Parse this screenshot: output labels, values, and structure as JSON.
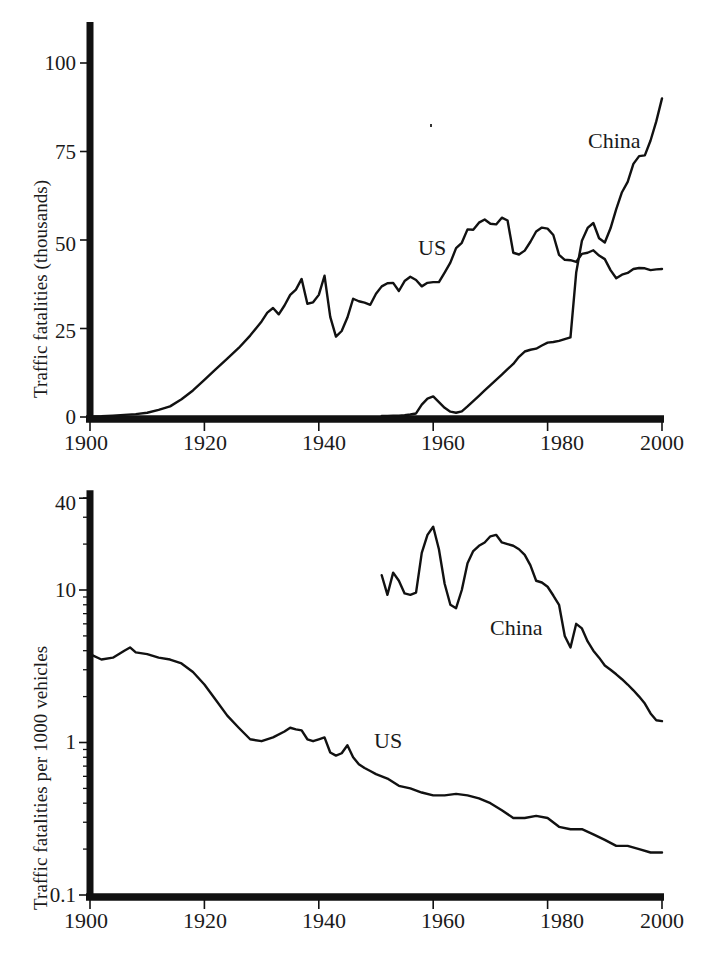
{
  "figure": {
    "background": "#ffffff",
    "ink": "#111111",
    "panels": [
      "top",
      "bottom"
    ]
  },
  "top": {
    "ylabel": "Traffic fatalities (thousands)",
    "xlabel": "",
    "yticks": [
      "0",
      "25",
      "50",
      "75",
      "100"
    ],
    "xticks": [
      "1900",
      "1920",
      "1940",
      "1960",
      "1980",
      "2000"
    ],
    "labels": {
      "us": "US",
      "china": "China"
    }
  },
  "bottom": {
    "ylabel": "Traffic fatalities per 1000 vehicles",
    "xlabel": "",
    "yticks": [
      "0.1",
      "1",
      "10",
      "40"
    ],
    "xticks": [
      "1900",
      "1920",
      "1940",
      "1960",
      "1980",
      "2000"
    ],
    "labels": {
      "us": "US",
      "china": "China"
    }
  },
  "chart_data": [
    {
      "type": "line",
      "id": "top",
      "title": "",
      "xlabel": "",
      "ylabel": "Traffic fatalities (thousands)",
      "xlim": [
        1900,
        2000
      ],
      "ylim": [
        0,
        110
      ],
      "yticks": [
        0,
        25,
        50,
        75,
        100
      ],
      "xticks": [
        1900,
        1920,
        1940,
        1960,
        1980,
        2000
      ],
      "yscale": "linear",
      "grid": false,
      "legend": "inline-annotation",
      "series": [
        {
          "name": "US",
          "label_position": {
            "x": 1958,
            "y": 44
          },
          "x": [
            1900,
            1902,
            1904,
            1906,
            1908,
            1910,
            1912,
            1914,
            1916,
            1918,
            1920,
            1922,
            1924,
            1926,
            1928,
            1930,
            1931,
            1932,
            1933,
            1934,
            1935,
            1936,
            1937,
            1938,
            1939,
            1940,
            1941,
            1942,
            1943,
            1944,
            1945,
            1946,
            1947,
            1948,
            1949,
            1950,
            1951,
            1952,
            1953,
            1954,
            1955,
            1956,
            1957,
            1958,
            1959,
            1960,
            1961,
            1962,
            1963,
            1964,
            1965,
            1966,
            1967,
            1968,
            1969,
            1970,
            1971,
            1972,
            1973,
            1974,
            1975,
            1976,
            1977,
            1978,
            1979,
            1980,
            1981,
            1982,
            1983,
            1984,
            1985,
            1986,
            1987,
            1988,
            1989,
            1990,
            1991,
            1992,
            1993,
            1994,
            1995,
            1996,
            1997,
            1998,
            1999,
            2000
          ],
          "y": [
            0.1,
            0.2,
            0.4,
            0.6,
            0.8,
            1.2,
            2.0,
            3.0,
            5.0,
            7.5,
            10.5,
            13.5,
            16.5,
            19.5,
            23.0,
            27.0,
            29.5,
            30.8,
            29.0,
            31.5,
            34.5,
            36.0,
            39.0,
            32.0,
            32.4,
            34.5,
            39.9,
            28.3,
            22.7,
            24.3,
            28.1,
            33.4,
            32.7,
            32.3,
            31.7,
            34.8,
            36.9,
            37.8,
            37.9,
            35.6,
            38.4,
            39.6,
            38.7,
            36.9,
            37.9,
            38.1,
            38.1,
            40.8,
            43.6,
            47.7,
            49.2,
            53.0,
            52.9,
            54.9,
            55.8,
            54.6,
            54.4,
            56.3,
            55.5,
            46.4,
            45.9,
            47.0,
            49.5,
            52.4,
            53.5,
            53.2,
            51.4,
            45.8,
            44.4,
            44.3,
            43.8,
            46.1,
            46.4,
            47.1,
            45.6,
            44.6,
            41.5,
            39.2,
            40.2,
            40.7,
            41.8,
            42.1,
            42.0,
            41.5,
            41.7,
            41.8
          ]
        },
        {
          "name": "China",
          "label_position": {
            "x": 1988,
            "y": 79
          },
          "x": [
            1951,
            1952,
            1953,
            1954,
            1955,
            1956,
            1957,
            1958,
            1959,
            1960,
            1961,
            1962,
            1963,
            1964,
            1965,
            1966,
            1967,
            1968,
            1969,
            1970,
            1971,
            1972,
            1973,
            1974,
            1975,
            1976,
            1977,
            1978,
            1979,
            1980,
            1981,
            1982,
            1983,
            1984,
            1985,
            1986,
            1987,
            1988,
            1989,
            1990,
            1991,
            1992,
            1993,
            1994,
            1995,
            1996,
            1997,
            1998,
            1999,
            2000
          ],
          "y": [
            0.3,
            0.3,
            0.4,
            0.4,
            0.5,
            0.7,
            1.0,
            3.5,
            5.2,
            5.8,
            4.2,
            2.6,
            1.5,
            1.2,
            1.6,
            3.0,
            4.5,
            6.0,
            7.5,
            9.0,
            10.5,
            12.0,
            13.5,
            15.0,
            17.0,
            18.5,
            19.0,
            19.3,
            20.2,
            21.0,
            21.2,
            21.5,
            22.0,
            22.5,
            40.8,
            49.8,
            53.4,
            54.8,
            50.5,
            49.3,
            53.3,
            58.7,
            63.5,
            66.4,
            71.5,
            73.7,
            73.9,
            78.1,
            83.5,
            90.0
          ]
        }
      ]
    },
    {
      "type": "line",
      "id": "bottom",
      "title": "",
      "xlabel": "",
      "ylabel": "Traffic fatalities per 1000 vehicles",
      "xlim": [
        1900,
        2000
      ],
      "ylim": [
        0.1,
        40
      ],
      "yticks": [
        0.1,
        1,
        10,
        40
      ],
      "xticks": [
        1900,
        1920,
        1940,
        1960,
        1980,
        2000
      ],
      "yscale": "log",
      "grid": false,
      "legend": "inline-annotation",
      "series": [
        {
          "name": "US",
          "label_position": {
            "x": 1950,
            "y": 1.15
          },
          "x": [
            1900,
            1902,
            1904,
            1906,
            1907,
            1908,
            1910,
            1912,
            1914,
            1916,
            1918,
            1920,
            1922,
            1924,
            1926,
            1928,
            1930,
            1932,
            1934,
            1935,
            1936,
            1937,
            1938,
            1939,
            1940,
            1941,
            1942,
            1943,
            1944,
            1945,
            1946,
            1947,
            1948,
            1949,
            1950,
            1952,
            1954,
            1956,
            1958,
            1960,
            1962,
            1964,
            1966,
            1968,
            1970,
            1972,
            1974,
            1976,
            1978,
            1980,
            1982,
            1984,
            1986,
            1988,
            1990,
            1992,
            1994,
            1996,
            1998,
            2000
          ],
          "y": [
            3.8,
            3.5,
            3.6,
            4.0,
            4.2,
            3.9,
            3.8,
            3.6,
            3.5,
            3.3,
            2.9,
            2.4,
            1.9,
            1.5,
            1.25,
            1.05,
            1.02,
            1.08,
            1.18,
            1.25,
            1.22,
            1.2,
            1.05,
            1.02,
            1.05,
            1.08,
            0.86,
            0.82,
            0.85,
            0.96,
            0.8,
            0.72,
            0.68,
            0.65,
            0.62,
            0.58,
            0.52,
            0.5,
            0.47,
            0.45,
            0.45,
            0.46,
            0.45,
            0.43,
            0.4,
            0.36,
            0.32,
            0.32,
            0.33,
            0.32,
            0.28,
            0.27,
            0.27,
            0.25,
            0.23,
            0.21,
            0.21,
            0.2,
            0.19,
            0.19
          ]
        },
        {
          "name": "China",
          "label_position": {
            "x": 1975,
            "y": 5.0
          },
          "x": [
            1951,
            1952,
            1953,
            1954,
            1955,
            1956,
            1957,
            1958,
            1959,
            1960,
            1961,
            1962,
            1963,
            1964,
            1965,
            1966,
            1967,
            1968,
            1969,
            1970,
            1971,
            1972,
            1973,
            1974,
            1975,
            1976,
            1977,
            1978,
            1979,
            1980,
            1981,
            1982,
            1983,
            1984,
            1985,
            1986,
            1987,
            1988,
            1989,
            1990,
            1991,
            1992,
            1993,
            1994,
            1995,
            1996,
            1997,
            1998,
            1999,
            2000
          ],
          "y": [
            12.5,
            9.3,
            13.0,
            11.5,
            9.5,
            9.3,
            9.6,
            17.5,
            23.0,
            26.0,
            18.5,
            11.0,
            8.0,
            7.6,
            10.0,
            15.0,
            18.0,
            19.5,
            20.5,
            22.5,
            23.0,
            20.5,
            20.0,
            19.5,
            18.5,
            17.0,
            14.5,
            11.5,
            11.2,
            10.5,
            9.2,
            8.0,
            5.0,
            4.2,
            6.0,
            5.6,
            4.6,
            4.0,
            3.6,
            3.2,
            3.0,
            2.8,
            2.6,
            2.4,
            2.2,
            2.0,
            1.8,
            1.55,
            1.4,
            1.38
          ]
        }
      ]
    }
  ]
}
